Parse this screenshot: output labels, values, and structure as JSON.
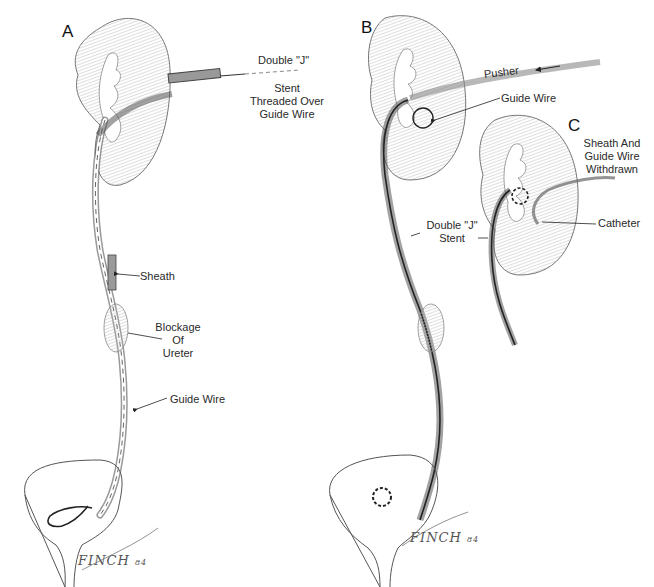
{
  "figure": {
    "panels": [
      {
        "letter": "A",
        "labels": {
          "double_j": "Double \"J\"",
          "stent_line1": "Stent",
          "stent_line2": "Threaded Over",
          "stent_line3": "Guide Wire",
          "sheath": "Sheath",
          "blockage_line1": "Blockage",
          "blockage_line2": "Of",
          "blockage_line3": "Ureter",
          "guide_wire": "Guide Wire"
        },
        "signature": "FINCH",
        "signature_year": "84"
      },
      {
        "letter": "B",
        "labels": {
          "pusher": "Pusher",
          "guide_wire": "Guide Wire",
          "double_j_line1": "Double \"J\"",
          "double_j_line2": "Stent"
        },
        "signature": "FINCH",
        "signature_year": "84"
      },
      {
        "letter": "C",
        "labels": {
          "line1": "Sheath And",
          "line2": "Guide Wire",
          "line3": "Withdrawn",
          "catheter": "Catheter"
        }
      }
    ],
    "colors": {
      "background": "#ffffff",
      "ink": "#222222",
      "shading": "#b8b8b8"
    }
  }
}
